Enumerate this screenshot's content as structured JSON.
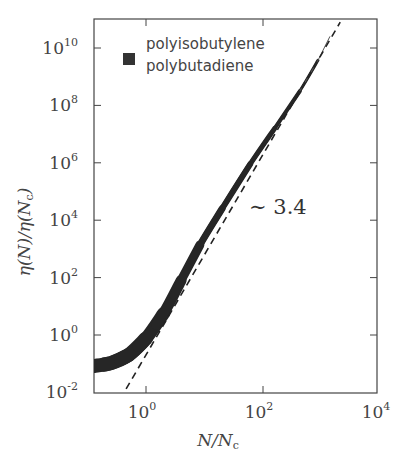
{
  "chart_data": {
    "type": "line",
    "title": "",
    "xlabel": "N/N_c",
    "ylabel": "η(N)/η(N_c)",
    "xscale": "log",
    "yscale": "log",
    "xlim_log10": [
      -0.89,
      3.95
    ],
    "ylim_log10": [
      -2,
      11
    ],
    "grid": false,
    "x_ticks": [
      {
        "exp": "0",
        "value": 1
      },
      {
        "exp": "2",
        "value": 100
      },
      {
        "exp": "4",
        "value": 10000
      }
    ],
    "y_ticks": [
      {
        "exp": "-2",
        "value": 0.01
      },
      {
        "exp": "0",
        "value": 1
      },
      {
        "exp": "2",
        "value": 100
      },
      {
        "exp": "4",
        "value": 10000
      },
      {
        "exp": "6",
        "value": 1000000
      },
      {
        "exp": "8",
        "value": 100000000
      },
      {
        "exp": "10",
        "value": 10000000000
      }
    ],
    "legend": {
      "position": "upper left",
      "marker_color": "#333333",
      "entries": [
        "polyisobutylene",
        "polybutadiene"
      ]
    },
    "series": [
      {
        "name": "polyisobutylene / polybutadiene (overlapping band)",
        "style": "thick solid band",
        "color": "#2a2a2a",
        "log10_x": [
          -0.89,
          -0.6,
          -0.3,
          0.0,
          0.3,
          0.6,
          0.92,
          1.3,
          1.78,
          2.2,
          2.63,
          2.94
        ],
        "log10_y": [
          -1.08,
          -0.98,
          -0.7,
          -0.12,
          0.75,
          1.9,
          3.13,
          4.4,
          5.95,
          7.2,
          8.5,
          9.57
        ]
      },
      {
        "name": "power law fit",
        "style": "dashed",
        "color": "#222222",
        "slope": 3.4,
        "log10_x": [
          -0.34,
          3.32
        ],
        "log10_y": [
          -1.88,
          10.9
        ]
      }
    ],
    "annotations": [
      {
        "text": "∼ 3.4",
        "log10_x": 2.0,
        "log10_y": 4.7
      }
    ]
  },
  "labels": {
    "xlabel_main": "N/N",
    "xlabel_sub": "c",
    "ylabel_text": "η(N)/η(N",
    "ylabel_sub": "c",
    "ylabel_end": ")",
    "tick_base": "10",
    "annotation": "∼ 3.4",
    "legend_1": "polyisobutylene",
    "legend_2": "polybutadiene"
  }
}
